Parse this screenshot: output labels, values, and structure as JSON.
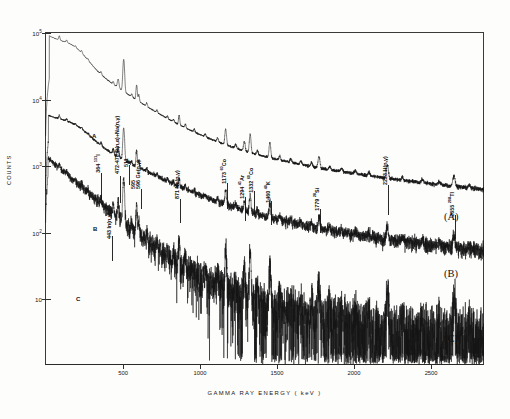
{
  "chart_data": {
    "type": "line",
    "title": "",
    "xlabel": "GAMMA  RAY  ENERGY  ( keV )",
    "ylabel": "COUNTS",
    "xlim": [
      0,
      2850
    ],
    "ylim_log": [
      1,
      100000
    ],
    "yscale": "log",
    "grid": false,
    "legend_position": "right-inline",
    "x_ticks": [
      {
        "value": 500,
        "label": "500"
      },
      {
        "value": 1000,
        "label": "1000"
      },
      {
        "value": 1500,
        "label": "1500"
      },
      {
        "value": 2000,
        "label": "2000"
      },
      {
        "value": 2500,
        "label": "2500"
      }
    ],
    "y_ticks": [
      {
        "value": 100000,
        "label": "10",
        "exp": "5"
      },
      {
        "value": 10000,
        "label": "10",
        "exp": "4"
      },
      {
        "value": 1000,
        "label": "10",
        "exp": "3"
      },
      {
        "value": 100,
        "label": "10",
        "exp": "2"
      },
      {
        "value": 10,
        "label": "10",
        "exp": ""
      }
    ],
    "series": [
      {
        "name": "(A)",
        "inline_tag": "A",
        "right_tag": "(A)",
        "description": "upper spectrum, highest count rate"
      },
      {
        "name": "(B)",
        "inline_tag": "B",
        "right_tag": "(B)",
        "description": "middle spectrum"
      },
      {
        "name": "(C)",
        "inline_tag": "C",
        "right_tag": "(C)",
        "description": "lower spectrum, noisiest"
      }
    ],
    "annotations": [
      {
        "energy": 364,
        "text": "364",
        "nuclide": "131I",
        "sup": "131",
        "base": "I"
      },
      {
        "energy": 443,
        "text": "443",
        "nuclide": "In(n,γ)",
        "sup": "",
        "base": "In(n,γ)"
      },
      {
        "energy": 475,
        "text": "472-478",
        "nuclide": "B(n,α)+Na(n,γ)",
        "sup": "",
        "base": "B(n,α)+Na(n,γ)"
      },
      {
        "energy": 511,
        "text": "511",
        "nuclide": "",
        "sup": "",
        "base": ""
      },
      {
        "energy": 595,
        "text": "595",
        "nuclide": "",
        "sup": "",
        "base": ""
      },
      {
        "energy": 596,
        "text": "596",
        "nuclide": "Ge(n,γ)",
        "sup": "",
        "base": "Ge(n,γ)"
      },
      {
        "energy": 871,
        "text": "871",
        "nuclide": "Ne(n,γ)",
        "sup": "",
        "base": "Ne(n,γ)"
      },
      {
        "energy": 1173,
        "text": "1173",
        "nuclide": "60Co",
        "sup": "60",
        "base": "Co"
      },
      {
        "energy": 1294,
        "text": "1294",
        "nuclide": "41Ar",
        "sup": "41",
        "base": "Ar"
      },
      {
        "energy": 1332,
        "text": "1332",
        "nuclide": "60Co",
        "sup": "60",
        "base": "Co"
      },
      {
        "energy": 1460,
        "text": "1460",
        "nuclide": "40K",
        "sup": "40",
        "base": "K"
      },
      {
        "energy": 1779,
        "text": "1779",
        "nuclide": "28Si",
        "sup": "28",
        "base": "Si"
      },
      {
        "energy": 2223,
        "text": "2223",
        "nuclide": "H(n,γ)",
        "sup": "",
        "base": "H(n,γ)"
      },
      {
        "energy": 2655,
        "text": "2655",
        "nuclide": "208Tl",
        "sup": "208",
        "base": "Tl"
      }
    ]
  },
  "axis": {
    "x_title": "GAMMA  RAY  ENERGY  ( keV )",
    "y_title": "COUNTS"
  }
}
